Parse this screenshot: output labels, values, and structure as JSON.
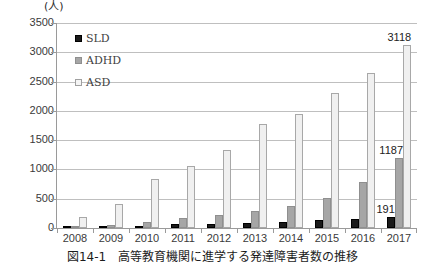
{
  "figure": {
    "unit_label": "(人)",
    "caption": "図14-1　高等教育機関に進学する発達障害者数の推移"
  },
  "legend": {
    "position": "top-left-inside",
    "items": [
      {
        "label": "SLD",
        "color": "#1a1a1a",
        "swatch": "filled-square-dark"
      },
      {
        "label": "ADHD",
        "color": "#a6a6a6",
        "swatch": "filled-square-gray"
      },
      {
        "label": "ASD",
        "color": "#f0f0f0",
        "swatch": "open-square-light"
      }
    ]
  },
  "axes": {
    "y_ticks": [
      "3500",
      "3000",
      "2500",
      "2000",
      "1500",
      "1000",
      "500",
      "0"
    ],
    "x_ticks": [
      "2008",
      "2009",
      "2010",
      "2011",
      "2012",
      "2013",
      "2014",
      "2015",
      "2016",
      "2017"
    ]
  },
  "data_labels": [
    {
      "name": "asd-2017-label",
      "text": "3118"
    },
    {
      "name": "adhd-2017-label",
      "text": "1187"
    },
    {
      "name": "sld-2017-label",
      "text": "191"
    }
  ],
  "chart_data": {
    "type": "bar",
    "title": "図14-1　高等教育機関に進学する発達障害者数の推移",
    "subtitle": "",
    "xlabel": "",
    "ylabel": "(人)",
    "ylim": [
      0,
      3500
    ],
    "ytick_step": 500,
    "grid": true,
    "legend_position": "upper left (inside plot)",
    "categories": [
      "2008",
      "2009",
      "2010",
      "2011",
      "2012",
      "2013",
      "2014",
      "2015",
      "2016",
      "2017"
    ],
    "series": [
      {
        "name": "SLD",
        "color": "#1a1a1a",
        "values": [
          12,
          25,
          42,
          65,
          75,
          88,
          95,
          130,
          150,
          191
        ]
      },
      {
        "name": "ADHD",
        "color": "#a6a6a6",
        "values": [
          30,
          55,
          110,
          175,
          230,
          290,
          375,
          510,
          790,
          1187
        ]
      },
      {
        "name": "ASD",
        "color": "#f0f0f0",
        "values": [
          185,
          415,
          845,
          1055,
          1325,
          1780,
          1955,
          2300,
          2645,
          3118
        ]
      }
    ],
    "annotations": [
      {
        "series": "ASD",
        "category": "2017",
        "value": 3118,
        "text": "3118"
      },
      {
        "series": "ADHD",
        "category": "2017",
        "value": 1187,
        "text": "1187"
      },
      {
        "series": "SLD",
        "category": "2017",
        "value": 191,
        "text": "191"
      }
    ]
  }
}
